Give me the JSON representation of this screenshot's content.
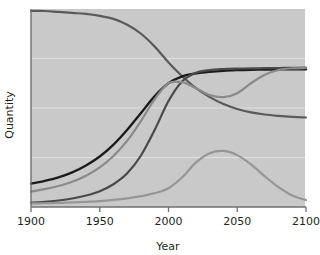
{
  "chart_data": {
    "type": "line",
    "title": "",
    "xlabel": "Year",
    "ylabel": "Quantity",
    "xlim": [
      1900,
      2100
    ],
    "ylim": [
      0,
      1
    ],
    "grid": true,
    "grid_axis": "y",
    "legend": "none",
    "xticks": [
      1900,
      1950,
      2000,
      2050,
      2100
    ],
    "xtick_labels": [
      "1900",
      "1950",
      "2000",
      "2050",
      "2100"
    ],
    "yticks": [],
    "ytick_labels": [],
    "gridline_values": [
      0.25,
      0.5,
      0.75
    ],
    "plot_background_color": "#c9c9c9",
    "figure_background_color": "#ffffff",
    "x": [
      1900,
      1910,
      1920,
      1930,
      1940,
      1950,
      1960,
      1970,
      1980,
      1990,
      2000,
      2010,
      2020,
      2030,
      2040,
      2050,
      2060,
      2070,
      2080,
      2090,
      2100
    ],
    "series": [
      {
        "name": "declining-curve",
        "color": "#5a5a5a",
        "linewidth": 2.2,
        "values": [
          0.99,
          0.99,
          0.985,
          0.98,
          0.975,
          0.965,
          0.95,
          0.92,
          0.875,
          0.81,
          0.73,
          0.66,
          0.6,
          0.555,
          0.52,
          0.495,
          0.478,
          0.467,
          0.46,
          0.455,
          0.452
        ]
      },
      {
        "name": "black-rising-curve",
        "color": "#1b1b1b",
        "linewidth": 2.3,
        "values": [
          0.118,
          0.132,
          0.15,
          0.175,
          0.21,
          0.255,
          0.315,
          0.39,
          0.475,
          0.56,
          0.625,
          0.66,
          0.675,
          0.683,
          0.688,
          0.691,
          0.693,
          0.694,
          0.695,
          0.695,
          0.695
        ]
      },
      {
        "name": "dark-gray-rising-curve",
        "color": "#4a4a4a",
        "linewidth": 2.2,
        "values": [
          0.022,
          0.026,
          0.033,
          0.043,
          0.058,
          0.08,
          0.115,
          0.17,
          0.26,
          0.39,
          0.535,
          0.635,
          0.678,
          0.692,
          0.697,
          0.699,
          0.7,
          0.701,
          0.702,
          0.703,
          0.704
        ]
      },
      {
        "name": "mid-gray-dip-curve",
        "color": "#8a8a8a",
        "linewidth": 2.2,
        "values": [
          0.078,
          0.09,
          0.106,
          0.128,
          0.158,
          0.2,
          0.258,
          0.335,
          0.435,
          0.545,
          0.625,
          0.63,
          0.6,
          0.565,
          0.555,
          0.575,
          0.625,
          0.668,
          0.692,
          0.7,
          0.702
        ]
      },
      {
        "name": "light-gray-hump-curve",
        "color": "#969696",
        "linewidth": 2.2,
        "values": [
          0.018,
          0.019,
          0.021,
          0.023,
          0.026,
          0.03,
          0.036,
          0.044,
          0.055,
          0.07,
          0.095,
          0.15,
          0.225,
          0.272,
          0.283,
          0.262,
          0.215,
          0.155,
          0.1,
          0.058,
          0.035
        ]
      }
    ]
  },
  "axes": {
    "x_axis_title": "Year",
    "y_axis_title": "Quantity"
  }
}
